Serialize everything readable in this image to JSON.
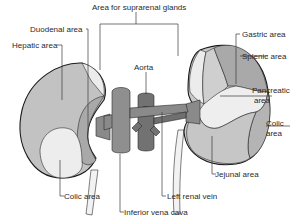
{
  "diagram": {
    "labels": {
      "suprarenal": "Area for suprarenal glands",
      "duodenal": "Duodenal area",
      "hepatic": "Hepatic area",
      "aorta": "Aorta",
      "gastric": "Gastric area",
      "splenic": "Splenic area",
      "pancreatic_1": "Pancreatic",
      "pancreatic_2": "area",
      "colic_right_1": "Colic",
      "colic_right_2": "area",
      "jejunal": "Jejunal area",
      "colic_left": "Colic area",
      "left_renal_vein": "Left renal vein",
      "ivc": "Inferior vena cava"
    },
    "colors": {
      "background": "#ffffff",
      "kidney_mid": "#bdbdbd",
      "kidney_light": "#d4d4d4",
      "area_pale": "#ececec",
      "area_dark": "#a9a9a9",
      "vessel": "#8a8a8a",
      "vessel_dark": "#6f6f6f",
      "ureter": "#f2f2f2",
      "outline": "#1a1a1a"
    }
  }
}
